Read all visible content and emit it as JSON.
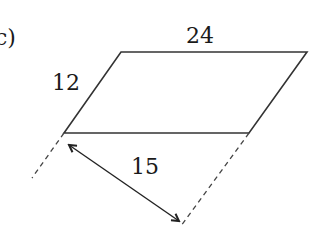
{
  "figure": {
    "part_label": "c)",
    "shape": "parallelogram",
    "labels": {
      "top_side": "24",
      "slanted_side": "12",
      "perpendicular_height": "15"
    },
    "colors": {
      "stroke": "#333333",
      "text": "#1a1a1a",
      "background": "#ffffff"
    },
    "vertices": {
      "top_left": [
        121,
        52
      ],
      "top_right": [
        307,
        52
      ],
      "bottom_right": [
        249,
        133
      ],
      "bottom_left": [
        64,
        133
      ]
    },
    "dashed_extensions": [
      {
        "from": [
          64,
          133
        ],
        "to": [
          32,
          178
        ]
      },
      {
        "from": [
          249,
          133
        ],
        "to": [
          181,
          226
        ]
      }
    ],
    "height_arrow": {
      "from": [
        67,
        143
      ],
      "to": [
        181,
        222
      ],
      "double_headed": true
    }
  }
}
